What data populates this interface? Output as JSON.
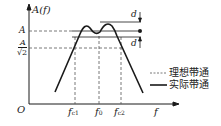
{
  "diagram": {
    "type": "bandpass-filter-frequency-response",
    "y_axis_label": "A(f)",
    "x_axis_label": "f",
    "origin_label": "O",
    "y_ticks": [
      {
        "label": "A",
        "y": 31
      },
      {
        "label_num": "A",
        "label_den": "√2",
        "y": 48
      }
    ],
    "x_ticks": [
      {
        "base": "f",
        "sub": "c1",
        "x": 75
      },
      {
        "base": "f",
        "sub": "0",
        "x": 99
      },
      {
        "base": "f",
        "sub": "c2",
        "x": 121
      }
    ],
    "ripple_label_top": "d",
    "ripple_label_bottom": "d",
    "legend": [
      {
        "style": "dashed",
        "label": "理想带通"
      },
      {
        "style": "solid",
        "label": "实际带通"
      }
    ],
    "colors": {
      "line": "#1a1a1a",
      "dashed": "#555555",
      "background": "#ffffff"
    }
  }
}
